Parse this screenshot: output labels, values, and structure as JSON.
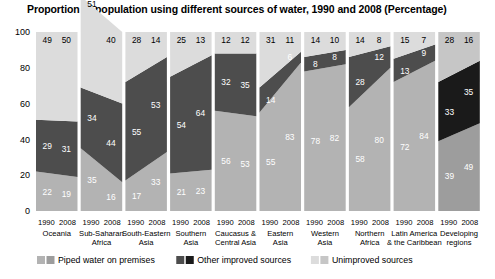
{
  "chart_data": {
    "type": "area",
    "title": "Proportion of population using different sources of water, 1990 and 2008 (Percentage)",
    "xlabel": "",
    "ylabel": "",
    "ylim": [
      0,
      100
    ],
    "yticks": [
      0,
      20,
      40,
      60,
      80,
      100
    ],
    "grid": false,
    "legend_position": "bottom",
    "x": [
      "1990",
      "2008"
    ],
    "categories": [
      "Oceania",
      "Sub-Saharan Africa",
      "South-Eastern Asia",
      "Southern Asia",
      "Caucasus & Central Asia",
      "Eastern Asia",
      "Western Asia",
      "Northern Africa",
      "Latin America & the Caribbean",
      "Developing regions"
    ],
    "series": [
      {
        "name": "Piped water on premises",
        "color": "#b3b3b3",
        "color_highlight": "#9d9d9d",
        "values": [
          [
            22,
            19
          ],
          [
            35,
            16
          ],
          [
            17,
            33
          ],
          [
            21,
            23
          ],
          [
            56,
            53
          ],
          [
            55,
            83
          ],
          [
            78,
            82
          ],
          [
            58,
            80
          ],
          [
            72,
            84
          ],
          [
            39,
            49
          ]
        ]
      },
      {
        "name": "Other improved sources",
        "color": "#4d4d4d",
        "color_highlight": "#1a1a1a",
        "values": [
          [
            29,
            31
          ],
          [
            34,
            44
          ],
          [
            55,
            53
          ],
          [
            54,
            64
          ],
          [
            32,
            35
          ],
          [
            14,
            6
          ],
          [
            8,
            8
          ],
          [
            28,
            12
          ],
          [
            13,
            9
          ],
          [
            33,
            35
          ]
        ]
      },
      {
        "name": "Unimproved sources",
        "color": "#dcdcdc",
        "color_highlight": "#c6c6c6",
        "values": [
          [
            49,
            50
          ],
          [
            51,
            40
          ],
          [
            28,
            14
          ],
          [
            25,
            13
          ],
          [
            12,
            12
          ],
          [
            31,
            11
          ],
          [
            14,
            10
          ],
          [
            14,
            8
          ],
          [
            15,
            7
          ],
          [
            28,
            16
          ]
        ]
      }
    ],
    "highlight_category": "Developing regions",
    "group_label_lines": [
      [
        "Oceania"
      ],
      [
        "Sub-Saharan",
        "Africa"
      ],
      [
        "South-Eastern",
        "Asia"
      ],
      [
        "Southern",
        "Asia"
      ],
      [
        "Caucasus &",
        "Central Asia"
      ],
      [
        "Eastern",
        "Asia"
      ],
      [
        "Western",
        "Asia"
      ],
      [
        "Northern",
        "Africa"
      ],
      [
        "Latin America",
        "& the Caribbean"
      ],
      [
        "Developing",
        "regions"
      ]
    ]
  },
  "legend": {
    "items": [
      {
        "label": "Piped water on premises",
        "swatch_light": "#b3b3b3",
        "swatch_dark": "#9d9d9d"
      },
      {
        "label": "Other improved sources",
        "swatch_light": "#4d4d4d",
        "swatch_dark": "#1a1a1a"
      },
      {
        "label": "Unimproved sources",
        "swatch_light": "#dcdcdc",
        "swatch_dark": "#c6c6c6"
      }
    ]
  }
}
